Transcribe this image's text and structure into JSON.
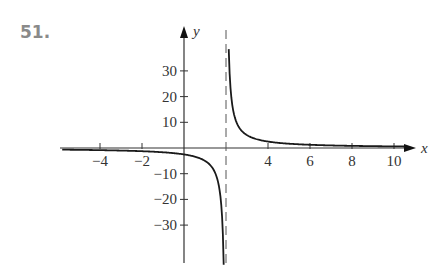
{
  "problem": {
    "number": "51."
  },
  "chart_data": {
    "type": "line",
    "title": "",
    "xlabel": "x",
    "ylabel": "y",
    "xlim": [
      -5.8,
      10.5
    ],
    "ylim": [
      -44,
      46
    ],
    "x_ticks": [
      -4,
      -2,
      4,
      6,
      8,
      10
    ],
    "x_tick_labels": [
      "−4",
      "−2",
      "4",
      "6",
      "8",
      "10"
    ],
    "y_ticks": [
      30,
      20,
      10,
      -10,
      -20,
      -30
    ],
    "y_tick_labels": [
      "30",
      "20",
      "10",
      "−10",
      "−20",
      "−30"
    ],
    "vertical_asymptote": {
      "x": 2,
      "style": "dashed"
    },
    "horizontal_asymptote": {
      "y": 0
    },
    "grid": false,
    "legend": null,
    "series": [
      {
        "name": "left branch",
        "x": [
          -5.8,
          -4,
          -2,
          -1,
          0,
          0.5,
          1,
          1.5,
          1.7,
          1.8,
          1.89
        ],
        "values": [
          -0.64,
          -0.83,
          -1.25,
          -1.67,
          -2.5,
          -3.33,
          -5,
          -10,
          -16.7,
          -25,
          -44
        ]
      },
      {
        "name": "right branch",
        "x": [
          2.13,
          2.2,
          2.3,
          2.5,
          3,
          4,
          5,
          6,
          8,
          10,
          10.5
        ],
        "values": [
          38.5,
          25,
          16.7,
          10,
          5,
          2.5,
          1.67,
          1.25,
          0.83,
          0.63,
          0.59
        ]
      }
    ],
    "colors": {
      "curve": "#1a1a1a",
      "axes": "#333333",
      "asymptote": "#555555"
    }
  }
}
